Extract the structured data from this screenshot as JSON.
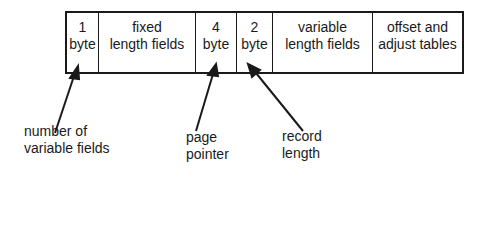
{
  "diagram": {
    "fields": [
      {
        "line1": "1",
        "line2": "byte"
      },
      {
        "line1": "fixed",
        "line2": "length fields"
      },
      {
        "line1": "4",
        "line2": "byte"
      },
      {
        "line1": "2",
        "line2": "byte"
      },
      {
        "line1": "variable",
        "line2": "length fields"
      },
      {
        "line1": "offset and",
        "line2": "adjust tables"
      }
    ],
    "annotations": [
      {
        "line1": "number of",
        "line2": "variable fields"
      },
      {
        "line1": "page",
        "line2": "pointer"
      },
      {
        "line1": "record",
        "line2": "length"
      }
    ]
  }
}
